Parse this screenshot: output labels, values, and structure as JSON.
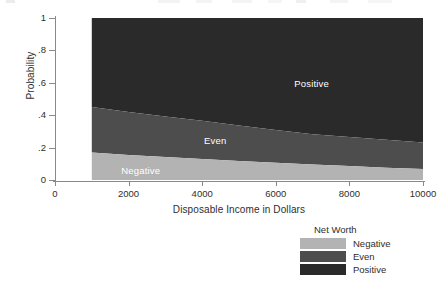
{
  "chart_data": {
    "type": "area",
    "subtype": "stacked-area",
    "title": "",
    "xlabel": "Disposable Income in Dollars",
    "ylabel": "Probability",
    "xlim": [
      0,
      10000
    ],
    "ylim": [
      0,
      1
    ],
    "data_xrange": [
      1000,
      10000
    ],
    "xticks": [
      "0",
      "2000",
      "4000",
      "6000",
      "8000",
      "10000"
    ],
    "xtick_values": [
      0,
      2000,
      4000,
      6000,
      8000,
      10000
    ],
    "yticks": [
      "0",
      ".2",
      ".4",
      ".6",
      ".8",
      "1"
    ],
    "ytick_values": [
      0,
      0.2,
      0.4,
      0.6,
      0.8,
      1
    ],
    "grid": false,
    "legend_position": "bottom-right",
    "legend_title": "Net Worth",
    "x": [
      1000,
      2000,
      3000,
      4000,
      5000,
      6000,
      7000,
      8000,
      9000,
      10000
    ],
    "series": [
      {
        "name": "Negative",
        "color": "#b3b3b3",
        "values": [
          0.17,
          0.155,
          0.142,
          0.13,
          0.118,
          0.107,
          0.096,
          0.086,
          0.076,
          0.068
        ]
      },
      {
        "name": "Even",
        "color": "#4d4d4d",
        "values": [
          0.28,
          0.265,
          0.25,
          0.235,
          0.218,
          0.202,
          0.187,
          0.18,
          0.172,
          0.164
        ]
      },
      {
        "name": "Positive",
        "color": "#2a2a2a",
        "values": [
          0.55,
          0.58,
          0.608,
          0.635,
          0.664,
          0.691,
          0.717,
          0.734,
          0.752,
          0.768
        ]
      }
    ],
    "cumulative_boundaries": {
      "negative_top": [
        0.17,
        0.155,
        0.142,
        0.13,
        0.118,
        0.107,
        0.096,
        0.086,
        0.076,
        0.068
      ],
      "even_top": [
        0.45,
        0.42,
        0.392,
        0.365,
        0.336,
        0.309,
        0.283,
        0.266,
        0.248,
        0.232
      ]
    },
    "annotations": [
      {
        "text": "Positive",
        "x": 6500,
        "y": 0.595,
        "color": "#ffffff"
      },
      {
        "text": "Even",
        "x": 4050,
        "y": 0.24,
        "color": "#ffffff"
      },
      {
        "text": "Negative",
        "x": 1800,
        "y": 0.055,
        "color": "#ffffff"
      }
    ]
  },
  "axes": {
    "y_title": "Probability",
    "x_title": "Disposable Income in Dollars",
    "ytick_labels": [
      "1",
      ".8",
      ".6",
      ".4",
      ".2",
      "0"
    ],
    "xtick_labels": [
      "0",
      "2000",
      "4000",
      "6000",
      "8000",
      "10000"
    ]
  },
  "plot_labels": {
    "positive": "Positive",
    "even": "Even",
    "negative": "Negative"
  },
  "legend": {
    "title": "Net Worth",
    "items": [
      {
        "label": "Negative",
        "color": "#b3b3b3"
      },
      {
        "label": "Even",
        "color": "#4d4d4d"
      },
      {
        "label": "Positive",
        "color": "#2a2a2a"
      }
    ]
  },
  "colors": {
    "negative": "#b3b3b3",
    "even": "#4d4d4d",
    "positive": "#2a2a2a",
    "axis": "#8a8a8a",
    "text": "#2e2e2e",
    "background": "#ffffff"
  }
}
